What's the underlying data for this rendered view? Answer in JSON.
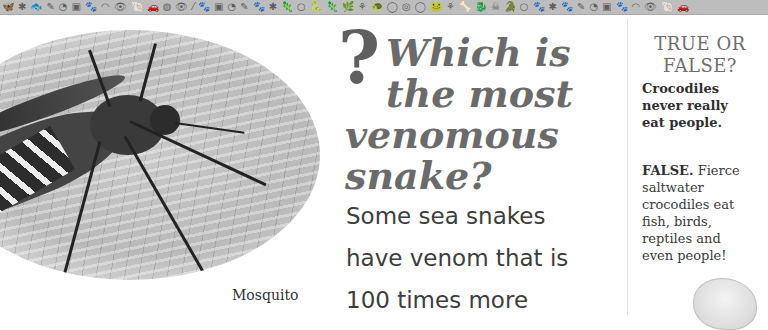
{
  "border": {
    "icons": [
      "🦋",
      "✱",
      "🐟",
      "✎",
      "◔",
      "▣",
      "🐾",
      "◠",
      "👁",
      "🐚",
      "🚗",
      "◍",
      "👁",
      "⁄",
      "🐾",
      "▣",
      "◔",
      "✎",
      "🐾",
      "✱",
      "🦎",
      "○",
      "🐍",
      "🦎",
      "🌿",
      "⚘",
      "🐢",
      "◯",
      "◎",
      "◯",
      "🐸",
      "⚘",
      "🦴",
      "🐉",
      "☠",
      "🐊",
      "○",
      "🐾",
      "✱",
      "🐾",
      "✎",
      "◔",
      "▣",
      "🐾",
      "◠",
      "👁",
      "🐚",
      "🚗"
    ]
  },
  "illustration": {
    "subject": "mosquito",
    "caption": "Mosquito"
  },
  "question": {
    "mark": "?",
    "line1": "Which is",
    "line2": "the most",
    "line3": "venomous",
    "line4": "snake?"
  },
  "answer": {
    "line1": "Some sea snakes",
    "line2": "have venom that is",
    "line3": "100 times more"
  },
  "true_false": {
    "title_line1": "TRUE OR",
    "title_line2": "FALSE?",
    "statement_line1": "Crocodiles",
    "statement_line2": "never really",
    "statement_line3": "eat people.",
    "verdict": "FALSE.",
    "answer_line1": " Fierce",
    "answer_line2": "saltwater",
    "answer_line3": "crocodiles eat",
    "answer_line4": "fish, birds,",
    "answer_line5": "reptiles and",
    "answer_line6": "even people!"
  },
  "colors": {
    "border_strip": "#bdbdbd",
    "question_text": "#6b6b6b",
    "body_text": "#3d3d3d"
  }
}
